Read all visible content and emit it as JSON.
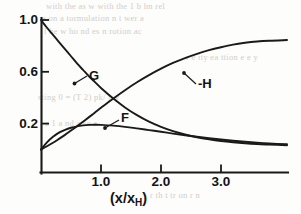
{
  "chart_data": {
    "type": "line",
    "title": "",
    "xlabel": "(x/x_H)",
    "ylabel": "",
    "xlim": [
      0,
      4.1
    ],
    "ylim": [
      0,
      1.08
    ],
    "grid": false,
    "legend_position": "inline-annotations",
    "x_ticks": [
      {
        "value": 1.0,
        "label": "1.0"
      },
      {
        "value": 2.0,
        "label": "2.0"
      },
      {
        "value": 3.0,
        "label": "3.0"
      }
    ],
    "y_ticks": [
      {
        "value": 0.2,
        "label": "0.2"
      },
      {
        "value": 0.6,
        "label": "0.6"
      },
      {
        "value": 1.0,
        "label": "1.0"
      }
    ],
    "series": [
      {
        "name": "G",
        "label": "G",
        "x": [
          0.0,
          0.1,
          0.2,
          0.3,
          0.4,
          0.5,
          0.6,
          0.7,
          0.8,
          0.9,
          1.0,
          1.2,
          1.4,
          1.6,
          1.8,
          2.0,
          2.2,
          2.4,
          2.6,
          2.8,
          3.0,
          3.2,
          3.4,
          3.6,
          3.8,
          4.1
        ],
        "y": [
          1.0,
          0.94,
          0.885,
          0.83,
          0.775,
          0.72,
          0.665,
          0.615,
          0.565,
          0.52,
          0.475,
          0.395,
          0.325,
          0.265,
          0.215,
          0.175,
          0.142,
          0.116,
          0.095,
          0.079,
          0.066,
          0.056,
          0.048,
          0.042,
          0.038,
          0.033
        ]
      },
      {
        "name": "-H",
        "label": "-H",
        "x": [
          0.0,
          0.1,
          0.2,
          0.3,
          0.4,
          0.5,
          0.6,
          0.7,
          0.8,
          0.9,
          1.0,
          1.2,
          1.4,
          1.6,
          1.8,
          2.0,
          2.2,
          2.4,
          2.6,
          2.8,
          3.0,
          3.2,
          3.4,
          3.6,
          3.8,
          4.1
        ],
        "y": [
          0.0,
          0.025,
          0.052,
          0.082,
          0.113,
          0.146,
          0.18,
          0.215,
          0.25,
          0.286,
          0.322,
          0.392,
          0.458,
          0.519,
          0.574,
          0.624,
          0.668,
          0.706,
          0.739,
          0.767,
          0.79,
          0.81,
          0.824,
          0.834,
          0.84,
          0.845
        ]
      },
      {
        "name": "F",
        "label": "F",
        "x": [
          0.0,
          0.1,
          0.2,
          0.3,
          0.4,
          0.5,
          0.6,
          0.7,
          0.8,
          0.9,
          1.0,
          1.2,
          1.4,
          1.6,
          1.8,
          2.0,
          2.2,
          2.4,
          2.6,
          2.8,
          3.0,
          3.2,
          3.4,
          3.6,
          3.8,
          4.1
        ],
        "y": [
          0.0,
          0.055,
          0.098,
          0.13,
          0.152,
          0.168,
          0.179,
          0.186,
          0.19,
          0.191,
          0.19,
          0.184,
          0.175,
          0.163,
          0.15,
          0.137,
          0.123,
          0.11,
          0.098,
          0.087,
          0.077,
          0.068,
          0.06,
          0.053,
          0.047,
          0.04
        ]
      }
    ],
    "annotations": [
      {
        "name": "G",
        "text": "G",
        "points_to_x": 0.55,
        "points_to_y": 0.69
      },
      {
        "name": "-H",
        "text": "-H",
        "points_to_x": 2.38,
        "points_to_y": 0.7
      },
      {
        "name": "F",
        "text": "F",
        "points_to_x": 1.05,
        "points_to_y": 0.188
      }
    ]
  },
  "axis": {
    "x_title_main": "(x/x",
    "x_title_sub": "H",
    "x_title_tail": ")"
  },
  "background_text": {
    "lines": [
      "with the as   w with the 1 b hn rel",
      "e on a tormulation  n t wer  a",
      "l he   w ho   nd  es n   rotion  ac",
      "r e    ity  ea  ttion    e    e  y",
      "sting    0 = (T  2)  pk/ p       y",
      "i  a   1  a       nd a      se   a",
      "r th   t   tr    on        r   n"
    ]
  }
}
